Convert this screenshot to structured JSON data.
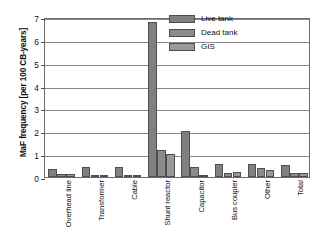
{
  "chart_data": {
    "type": "bar",
    "title": "",
    "xlabel": "",
    "ylabel": "MaF frequency [per 100 CB-years]",
    "ylim": [
      0,
      7
    ],
    "ytick_labels": [
      "0",
      "1",
      "2",
      "3",
      "4",
      "5",
      "6",
      "7"
    ],
    "ytick_values": [
      0,
      1,
      2,
      3,
      4,
      5,
      6,
      7
    ],
    "grid": true,
    "legend_position": "upper right inside",
    "categories": [
      "Overhead line",
      "Transformer",
      "Cable",
      "Shunt reactor",
      "Capacitor",
      "Bus coupler",
      "Other",
      "Total"
    ],
    "series": [
      {
        "name": "Live tank",
        "color": "#808080",
        "values": [
          0.35,
          0.45,
          0.45,
          6.8,
          2.0,
          0.55,
          0.55,
          0.52
        ]
      },
      {
        "name": "Dead tank",
        "color": "#8c8c8c",
        "values": [
          0.12,
          0.08,
          0.06,
          1.2,
          0.42,
          0.17,
          0.38,
          0.18
        ]
      },
      {
        "name": "GIS",
        "color": "#999999",
        "values": [
          0.15,
          0.1,
          0.02,
          1.0,
          0.1,
          0.22,
          0.32,
          0.17
        ]
      }
    ]
  },
  "axes": {
    "frame_color": "#6b6b6b",
    "grid_color": "#8a8a8a",
    "text_color": "#111111"
  }
}
